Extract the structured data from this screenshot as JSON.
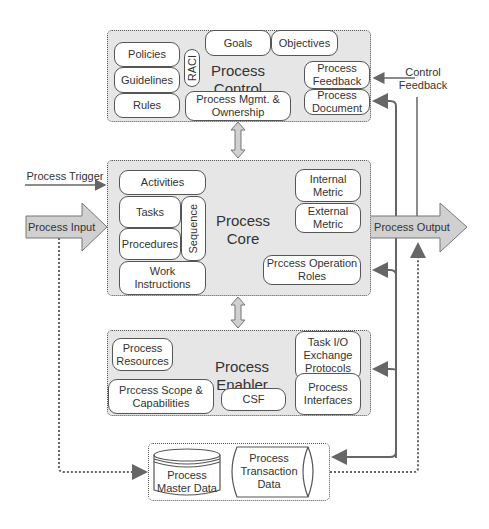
{
  "control": {
    "title_line1": "Process",
    "title_line2": "Control",
    "goals": "Goals",
    "objectives": "Objectives",
    "policies": "Policies",
    "guidelines": "Guidelines",
    "rules": "Rules",
    "raci": "RACI",
    "mgmt_line1": "Process Mgmt. &",
    "mgmt_line2": "Ownership",
    "feedback_line1": "Process",
    "feedback_line2": "Feedback",
    "document_line1": "Process",
    "document_line2": "Document"
  },
  "core": {
    "title_line1": "Process",
    "title_line2": "Core",
    "activities": "Activities",
    "tasks": "Tasks",
    "procedures": "Procedures",
    "sequence": "Sequence",
    "work_line1": "Work",
    "work_line2": "Instructions",
    "internal_line1": "Internal",
    "internal_line2": "Metric",
    "external_line1": "External",
    "external_line2": "Metric",
    "roles_line1": "Prccess Operation",
    "roles_line2": "Roles"
  },
  "enabler": {
    "title_line1": "Process",
    "title_line2": "Enabler",
    "resources_line1": "Process",
    "resources_line2": "Resources",
    "scope_line1": "Prccess Scope &",
    "scope_line2": "Capabilities",
    "csf": "CSF",
    "taskio_line1": "Task I/O",
    "taskio_line2": "Exchange",
    "taskio_line3": "Protocols",
    "interfaces_line1": "Process",
    "interfaces_line2": "Interfaces"
  },
  "data_store": {
    "master_line1": "Process",
    "master_line2": "Master Data",
    "transaction_line1": "Process",
    "transaction_line2": "Transaction",
    "transaction_line3": "Data"
  },
  "external": {
    "trigger": "Process Trigger",
    "input": "Process Input",
    "output": "Process Output",
    "control_feedback_line1": "Control",
    "control_feedback_line2": "Feedback"
  },
  "colors": {
    "group_fill": "#e6e6e6",
    "box_fill": "#ffffff",
    "stroke": "#555555",
    "arrow_fill": "#d0d0d0"
  }
}
